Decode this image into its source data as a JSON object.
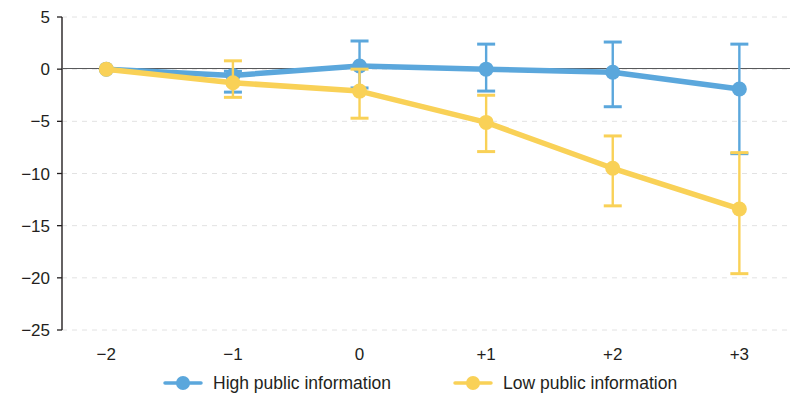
{
  "chart_data": {
    "type": "line",
    "title": "",
    "xlabel": "",
    "ylabel": "",
    "x": [
      -2,
      -1,
      0,
      1,
      2,
      3
    ],
    "categories": [
      "−2",
      "−1",
      "0",
      "+1",
      "+2",
      "+3"
    ],
    "ylim": [
      -25,
      5
    ],
    "xlim": [
      -2.35,
      3.4
    ],
    "yticks": [
      5,
      0,
      -5,
      -10,
      -15,
      -20,
      -25
    ],
    "ytick_labels": [
      "5",
      "0",
      "−5",
      "−10",
      "−15",
      "−20",
      "−25"
    ],
    "grid": true,
    "grid_axis": "y",
    "grid_style": "dashed",
    "legend_position": "bottom",
    "zero_line": true,
    "series": [
      {
        "name": "High public information",
        "color": "#5BA7DC",
        "marker": "circle",
        "values": [
          0.0,
          -0.6,
          0.3,
          0.0,
          -0.3,
          -1.9
        ],
        "err_upper": [
          0.0,
          0.4,
          2.4,
          2.4,
          2.9,
          4.3
        ],
        "err_lower": [
          0.0,
          1.6,
          2.1,
          2.1,
          3.3,
          6.2
        ]
      },
      {
        "name": "Low public information",
        "color": "#F9D157",
        "marker": "circle",
        "values": [
          0.0,
          -1.3,
          -2.1,
          -5.1,
          -9.5,
          -13.4
        ],
        "err_upper": [
          0.0,
          2.1,
          2.1,
          2.6,
          3.1,
          5.4
        ],
        "err_lower": [
          0.0,
          1.4,
          2.6,
          2.8,
          3.6,
          6.2
        ]
      }
    ]
  },
  "legend": {
    "items": [
      {
        "label": "High public information",
        "color": "#5BA7DC"
      },
      {
        "label": "Low public information",
        "color": "#F9D157"
      }
    ]
  },
  "axes": {
    "axis_color": "#231f20",
    "grid_color": "#e2e2e2",
    "zero_line_color": "#58595b"
  }
}
